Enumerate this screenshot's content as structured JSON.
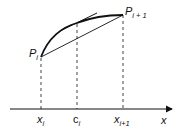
{
  "diagram": {
    "points": {
      "p_i": {
        "label": "P",
        "sub": "i"
      },
      "p_i1": {
        "label": "P",
        "sub": "i + 1"
      }
    },
    "axis": {
      "label": "x",
      "ticks": [
        {
          "label": "x",
          "sub": "i"
        },
        {
          "label": "c",
          "sub": "i"
        },
        {
          "label": "x",
          "sub": "i+1"
        }
      ]
    },
    "colors": {
      "stroke": "#111111",
      "background": "#ffffff"
    }
  }
}
